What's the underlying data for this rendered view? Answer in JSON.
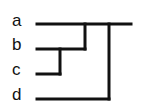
{
  "diagram": {
    "type": "dendrogram",
    "leaves": [
      {
        "label": "a",
        "y": 24
      },
      {
        "label": "b",
        "y": 49
      },
      {
        "label": "c",
        "y": 74
      },
      {
        "label": "d",
        "y": 99
      }
    ],
    "structure": "((a,(b,c)),d)",
    "line_color": "#111111"
  }
}
